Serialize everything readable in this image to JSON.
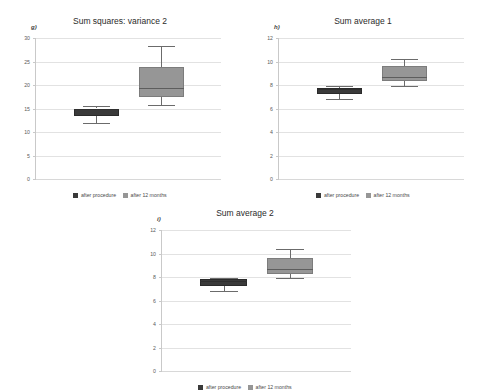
{
  "figure": {
    "background": "#ffffff",
    "series_colors": {
      "after_procedure": "#3a3a3a",
      "after_12_months": "#969696"
    },
    "gridline_color": "#e2e2e2",
    "axis_color": "#c9c9c9"
  },
  "legend": {
    "items": [
      {
        "label": "after procedure",
        "color": "#3a3a3a"
      },
      {
        "label": "after 12 months",
        "color": "#969696"
      }
    ]
  },
  "chart_data": [
    {
      "type": "box",
      "panel_label": "g)",
      "title": "Sum squares: variance 2",
      "xlabel": "",
      "ylabel": "",
      "ylim": [
        0,
        30
      ],
      "yticks": [
        0,
        5,
        10,
        15,
        20,
        25,
        30
      ],
      "ytick_labels": [
        "0",
        "5",
        "10",
        "15",
        "20",
        "25",
        "30"
      ],
      "grid": true,
      "legend_position": "bottom",
      "categories": [
        "after procedure",
        "after 12 months"
      ],
      "boxes": [
        {
          "name": "after procedure",
          "color": "#3a3a3a",
          "whisker_low": 12.0,
          "q1": 13.3,
          "median": 14.8,
          "q3": 15.0,
          "whisker_high": 15.6
        },
        {
          "name": "after 12 months",
          "color": "#969696",
          "whisker_low": 15.7,
          "q1": 17.4,
          "median": 19.4,
          "q3": 23.9,
          "whisker_high": 28.2
        }
      ]
    },
    {
      "type": "box",
      "panel_label": "h)",
      "title": "Sum average 1",
      "xlabel": "",
      "ylabel": "",
      "ylim": [
        0,
        12
      ],
      "yticks": [
        0,
        2,
        4,
        6,
        8,
        10,
        12
      ],
      "ytick_labels": [
        "0",
        "2",
        "4",
        "6",
        "8",
        "10",
        "12"
      ],
      "grid": true,
      "legend_position": "bottom",
      "categories": [
        "after procedure",
        "after 12 months"
      ],
      "boxes": [
        {
          "name": "after procedure",
          "color": "#3a3a3a",
          "whisker_low": 6.85,
          "q1": 7.2,
          "median": 7.65,
          "q3": 7.75,
          "whisker_high": 7.9
        },
        {
          "name": "after 12 months",
          "color": "#969696",
          "whisker_low": 7.9,
          "q1": 8.3,
          "median": 8.65,
          "q3": 9.6,
          "whisker_high": 10.2
        }
      ]
    },
    {
      "type": "box",
      "panel_label": "i)",
      "title": "Sum average 2",
      "xlabel": "",
      "ylabel": "",
      "ylim": [
        0,
        12
      ],
      "yticks": [
        0,
        2,
        4,
        6,
        8,
        10,
        12
      ],
      "ytick_labels": [
        "0",
        "2",
        "4",
        "6",
        "8",
        "10",
        "12"
      ],
      "grid": true,
      "legend_position": "bottom",
      "categories": [
        "after procedure",
        "after 12 months"
      ],
      "boxes": [
        {
          "name": "after procedure",
          "color": "#3a3a3a",
          "whisker_low": 6.85,
          "q1": 7.2,
          "median": 7.7,
          "q3": 7.8,
          "whisker_high": 7.95
        },
        {
          "name": "after 12 months",
          "color": "#969696",
          "whisker_low": 7.9,
          "q1": 8.25,
          "median": 8.7,
          "q3": 9.65,
          "whisker_high": 10.4
        }
      ]
    }
  ]
}
